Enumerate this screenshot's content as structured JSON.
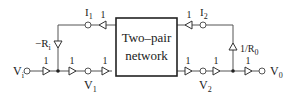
{
  "diagram": {
    "type": "signal-flow graph",
    "block": {
      "line1": "Two–pair",
      "line2": "network"
    },
    "nodes": {
      "vi": "V",
      "vi_sub": "i",
      "v1": "V",
      "v1_sub": "1",
      "v2": "V",
      "v2_sub": "2",
      "v0": "V",
      "v0_sub": "0",
      "i1": "I",
      "i1_sub": "1",
      "i2": "I",
      "i2_sub": "2"
    },
    "gains": {
      "vi_to_junction": "1",
      "junction_to_v1": "1",
      "v1_to_network": "1",
      "network_to_i1": "1",
      "network_to_v2": "1",
      "v2_to_junction": "1",
      "junction_to_v0": "1",
      "network_to_i2": "1",
      "feedback_left": "−R",
      "feedback_left_sub": "i",
      "feedback_right": "1/R",
      "feedback_right_sub": "0"
    }
  }
}
